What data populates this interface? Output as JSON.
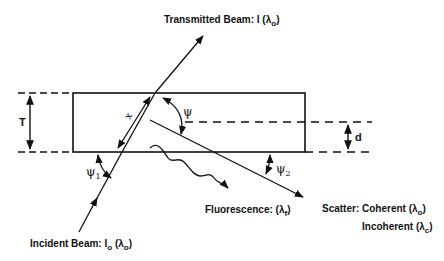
{
  "diagram": {
    "labels": {
      "transmitted": {
        "text": "Transmitted Beam: I (λ",
        "sub": "o",
        "close": ")"
      },
      "incident": {
        "text": "Incident Beam: I",
        "sub1": "o",
        "mid": " (λ",
        "sub2": "o",
        "close": ")"
      },
      "fluorescence": {
        "text": "Fluorescence: (λ",
        "sub": "f",
        "close": ")"
      },
      "scatter_coherent": {
        "text": "Scatter: Coherent (λ",
        "sub": "o",
        "close": ")"
      },
      "scatter_incoherent": {
        "text": "Incoherent (λ",
        "sub": "c",
        "close": ")"
      },
      "thickness": "T",
      "depth": "d",
      "path_length": "x",
      "angle_psi": "ψ",
      "angle_psi1": {
        "text": "ψ",
        "sub": "1"
      },
      "angle_psi2": {
        "text": "ψ",
        "sub": "2"
      }
    },
    "colors": {
      "line": "#111111",
      "background": "#ffffff"
    }
  }
}
